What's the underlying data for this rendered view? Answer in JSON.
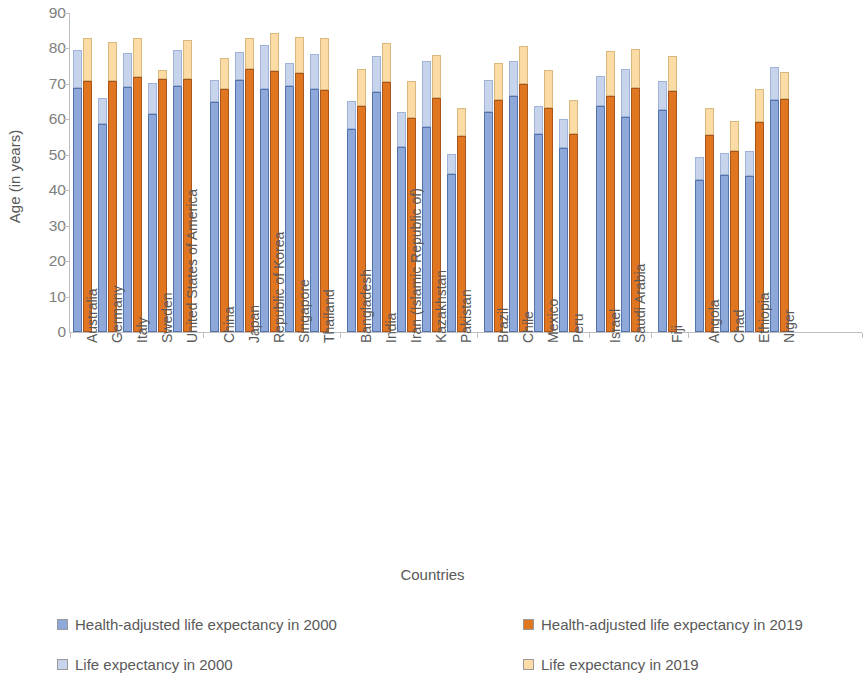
{
  "chart_data": {
    "type": "bar",
    "title": "",
    "xlabel": "Countries",
    "ylabel": "Age (in years)",
    "ylim": [
      0,
      90
    ],
    "yticks": [
      0,
      10,
      20,
      30,
      40,
      50,
      60,
      70,
      80,
      90
    ],
    "grid": false,
    "legend_position": "bottom",
    "stacked": "segments: health-adjusted life expectancy (lower, solid) + remainder to life expectancy (upper, light)",
    "groups": [
      {
        "name": "group-1",
        "countries": [
          "Australia",
          "Germany",
          "Italy",
          "Sweden",
          "United States of America"
        ]
      },
      {
        "name": "group-2",
        "countries": [
          "China",
          "Japan",
          "Republic of Korea",
          "Singapore",
          "Thailand"
        ]
      },
      {
        "name": "group-3",
        "countries": [
          "Bangladesh",
          "India",
          "Iran (Islamic Republic of)",
          "Kazakhstan",
          "Pakistan"
        ]
      },
      {
        "name": "group-4",
        "countries": [
          "Brazil",
          "Chile",
          "Mexico",
          "Peru"
        ]
      },
      {
        "name": "group-5",
        "countries": [
          "Israel",
          "Saudi Arabia"
        ]
      },
      {
        "name": "group-6",
        "countries": [
          "Fiji"
        ]
      },
      {
        "name": "group-7",
        "countries": [
          "Angola",
          "Chad",
          "Ethiopia",
          "Niger"
        ]
      }
    ],
    "categories": [
      "Australia",
      "Germany",
      "Italy",
      "Sweden",
      "United States of America",
      "China",
      "Japan",
      "Republic of Korea",
      "Singapore",
      "Thailand",
      "Bangladesh",
      "India",
      "Iran (Islamic Republic of)",
      "Kazakhstan",
      "Pakistan",
      "Brazil",
      "Chile",
      "Mexico",
      "Peru",
      "Israel",
      "Saudi Arabia",
      "Fiji",
      "Angola",
      "Chad",
      "Ethiopia",
      "Niger"
    ],
    "series": [
      {
        "name": "Health-adjusted life expectancy in 2000",
        "color": "#8ea9d9",
        "values": [
          68.9,
          58.8,
          69.2,
          61.5,
          69.3,
          65.0,
          71.1,
          68.5,
          69.3,
          60.8,
          57.4,
          56.9,
          52.3,
          57.9,
          44.6,
          62.0,
          66.5,
          56.0,
          51.8,
          63.9,
          60.8,
          62.6,
          43.0,
          44.4,
          44.1,
          43.8
        ]
      },
      {
        "name": "Life expectancy in 2000",
        "color": "#c7d4ec",
        "values": [
          79.7,
          66.1,
          78.7,
          70.2,
          79.5,
          71.0,
          81.1,
          75.9,
          76.1,
          70.6,
          65.3,
          62.8,
          68.7,
          62.1,
          63.4,
          65.5,
          68.7,
          76.5,
          71.4,
          72.3,
          74.2,
          70.8,
          49.3,
          50.6,
          51.1,
          74.7
        ]
      },
      {
        "name": "Health-adjusted life expectancy in 2019",
        "color": "#e0761f",
        "values": [
          70.9,
          70.9,
          71.9,
          71.3,
          71.3,
          68.5,
          74.1,
          73.1,
          73.6,
          68.3,
          63.7,
          60.3,
          65.9,
          60.4,
          55.4,
          65.4,
          70.0,
          63.3,
          61.6,
          72.4,
          66.7,
          68.0,
          55.6,
          51.0,
          59.3,
          55.7
        ]
      },
      {
        "name": "Life expectancy in 2019",
        "color": "#fbdca7",
        "values": [
          83.0,
          81.7,
          83.0,
          82.4,
          78.5,
          77.4,
          84.3,
          83.3,
          83.2,
          77.7,
          74.3,
          70.8,
          77.3,
          63.1,
          65.6,
          75.9,
          80.7,
          76.0,
          79.9,
          82.6,
          74.3,
          77.8,
          63.1,
          59.6,
          68.7,
          63.3
        ]
      }
    ],
    "bar_segments": {
      "Australia": {
        "hale2000": 68.9,
        "le2000": 79.7,
        "hale2019": 70.9,
        "le2019": 83.0
      },
      "Germany": {
        "hale2000": 58.8,
        "le2000": 66.1,
        "hale2019": 70.9,
        "le2019": 81.7
      },
      "Italy": {
        "hale2000": 69.2,
        "le2000": 78.7,
        "hale2019": 71.9,
        "le2019": 83.0
      },
      "Sweden": {
        "hale2000": 61.5,
        "le2000": 70.2,
        "hale2019": 71.3,
        "le2019": 74.0
      },
      "United States of America": {
        "hale2000": 69.3,
        "le2000": 79.5,
        "hale2019": 71.3,
        "le2019": 82.4
      },
      "China": {
        "hale2000": 65.0,
        "le2000": 71.0,
        "hale2019": 68.5,
        "le2019": 77.4
      },
      "Japan": {
        "hale2000": 71.1,
        "le2000": 79.0,
        "hale2019": 74.1,
        "le2019": 83.0
      },
      "Republic of Korea": {
        "hale2000": 68.5,
        "le2000": 81.1,
        "hale2019": 73.6,
        "le2019": 84.3
      },
      "Singapore": {
        "hale2000": 69.3,
        "le2000": 75.9,
        "hale2019": 73.1,
        "le2019": 83.2
      },
      "Thailand": {
        "hale2000": 68.5,
        "le2000": 78.3,
        "hale2019": 68.3,
        "le2019": 83.0
      },
      "Bangladesh": {
        "hale2000": 57.4,
        "le2000": 65.3,
        "hale2019": 63.7,
        "le2019": 74.3
      },
      "India": {
        "hale2000": 67.8,
        "le2000": 78.0,
        "hale2019": 70.5,
        "le2019": 81.6
      },
      "Iran (Islamic Republic of)": {
        "hale2000": 52.3,
        "le2000": 62.1,
        "hale2019": 60.3,
        "le2019": 70.8
      },
      "Kazakhstan": {
        "hale2000": 57.9,
        "le2000": 76.5,
        "hale2019": 65.9,
        "le2019": 78.2
      },
      "Pakistan": {
        "hale2000": 44.6,
        "le2000": 50.3,
        "hale2019": 55.4,
        "le2019": 63.1
      },
      "Brazil": {
        "hale2000": 62.0,
        "le2000": 71.2,
        "hale2019": 65.4,
        "le2019": 75.9
      },
      "Chile": {
        "hale2000": 66.5,
        "le2000": 76.5,
        "hale2019": 70.0,
        "le2019": 80.7
      },
      "Mexico": {
        "hale2000": 56.0,
        "le2000": 63.9,
        "hale2019": 63.3,
        "le2019": 74.0
      },
      "Peru": {
        "hale2000": 51.8,
        "le2000": 60.2,
        "hale2019": 56.0,
        "le2019": 65.6
      },
      "Israel": {
        "hale2000": 63.9,
        "le2000": 72.3,
        "hale2019": 66.7,
        "le2019": 79.2
      },
      "Saudi Arabia": {
        "hale2000": 60.8,
        "le2000": 74.2,
        "hale2019": 68.9,
        "le2019": 79.9
      },
      "Fiji": {
        "hale2000": 62.6,
        "le2000": 70.8,
        "hale2019": 68.0,
        "le2019": 77.8
      },
      "Angola": {
        "hale2000": 43.0,
        "le2000": 49.3,
        "hale2019": 55.6,
        "le2019": 63.1
      },
      "Chad": {
        "hale2000": 44.4,
        "le2000": 50.6,
        "hale2019": 51.0,
        "le2019": 59.6
      },
      "Ethiopia": {
        "hale2000": 44.1,
        "le2000": 51.1,
        "hale2019": 59.3,
        "le2019": 68.7
      },
      "Niger": {
        "hale2000": 65.5,
        "le2000": 74.7,
        "hale2019": 65.7,
        "le2019": 73.4
      }
    }
  },
  "axes": {
    "y_title": "Age (in years)",
    "x_title": "Countries",
    "y_ticks": [
      "90",
      "80",
      "70",
      "60",
      "50",
      "40",
      "30",
      "20",
      "10",
      "0"
    ]
  },
  "legend": {
    "items": [
      {
        "label": "Health-adjusted life expectancy in 2000",
        "color": "#8ea9d9"
      },
      {
        "label": "Life expectancy in 2000",
        "color": "#c7d4ec"
      },
      {
        "label": "Health-adjusted life expectancy in 2019",
        "color": "#e0761f"
      },
      {
        "label": "Life expectancy in 2019",
        "color": "#fbdca7"
      }
    ]
  }
}
